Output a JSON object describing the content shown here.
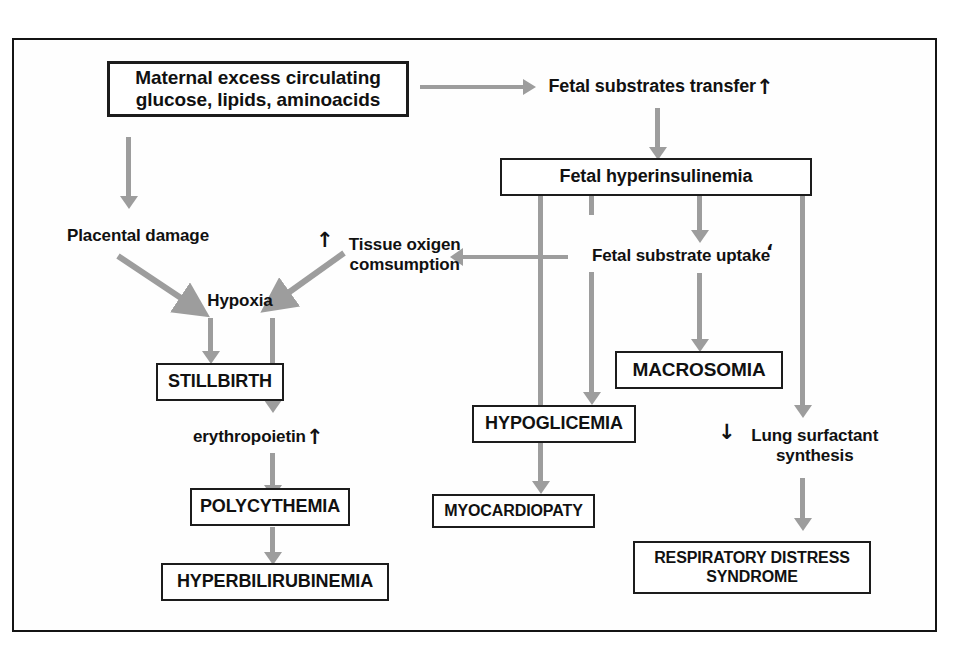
{
  "diagram": {
    "frame_color": "#141414",
    "arrow_color": "#9d9d9d",
    "text_color": "#111111",
    "background": "#ffffff"
  },
  "nodes": {
    "maternal_excess": {
      "label": "Maternal excess circulating\nglucose, lipids, aminoacids",
      "style": "boxed-thick"
    },
    "fetal_substrates_transfer": {
      "label": "Fetal substrates transfer",
      "arrow_glyph": "↑",
      "style": "plain"
    },
    "fetal_hyperinsulinemia": {
      "label": "Fetal hyperinsulinemia",
      "style": "boxed"
    },
    "placental_damage": {
      "label": "Placental damage",
      "style": "plain"
    },
    "tissue_oxigen": {
      "label": "Tissue oxigen\ncomsumption",
      "arrow_glyph": "↑",
      "style": "plain"
    },
    "fetal_substrate_uptake": {
      "label": "Fetal substrate uptake",
      "mark": "‘",
      "style": "plain"
    },
    "hypoxia": {
      "label": "Hypoxia",
      "style": "plain"
    },
    "stillbirth": {
      "label": "STILLBIRTH",
      "style": "boxed"
    },
    "erythropoietin": {
      "label": "erythropoietin",
      "arrow_glyph": "↑",
      "style": "plain"
    },
    "macrosomia": {
      "label": "MACROSOMIA",
      "style": "boxed"
    },
    "hypoglicemia": {
      "label": "HYPOGLICEMIA",
      "style": "boxed"
    },
    "lung_surfactant": {
      "label": "Lung surfactant\nsynthesis",
      "arrow_glyph": "↓",
      "style": "plain"
    },
    "polycythemia": {
      "label": "POLYCYTHEMIA",
      "style": "boxed"
    },
    "myocardiopaty": {
      "label": "MYOCARDIOPATY",
      "style": "boxed"
    },
    "hyperbilirubinemia": {
      "label": "HYPERBILIRUBINEMIA",
      "style": "boxed"
    },
    "respiratory_distress": {
      "label": "RESPIRATORY DISTRESS\nSYNDROME",
      "style": "boxed"
    }
  },
  "edges": [
    {
      "from": "maternal_excess",
      "to": "fetal_substrates_transfer",
      "kind": "horizontal-arrow"
    },
    {
      "from": "maternal_excess",
      "to": "placental_damage",
      "kind": "vertical-arrow"
    },
    {
      "from": "fetal_substrates_transfer",
      "to": "fetal_hyperinsulinemia",
      "kind": "vertical-arrow"
    },
    {
      "from": "placental_damage",
      "to": "hypoxia",
      "kind": "diagonal-arrow"
    },
    {
      "from": "tissue_oxigen",
      "to": "hypoxia",
      "kind": "diagonal-arrow"
    },
    {
      "from": "fetal_substrate_uptake",
      "to": "tissue_oxigen",
      "kind": "horizontal-arrow"
    },
    {
      "from": "fetal_hyperinsulinemia",
      "to": "fetal_substrate_uptake",
      "kind": "vertical-arrow"
    },
    {
      "from": "fetal_hyperinsulinemia",
      "to": "hypoglicemia",
      "kind": "vertical-arrow"
    },
    {
      "from": "fetal_hyperinsulinemia",
      "to": "myocardiopaty",
      "kind": "vertical-line"
    },
    {
      "from": "fetal_hyperinsulinemia",
      "to": "lung_surfactant",
      "kind": "vertical-arrow"
    },
    {
      "from": "fetal_substrate_uptake",
      "to": "macrosomia",
      "kind": "vertical-arrow"
    },
    {
      "from": "hypoxia",
      "to": "stillbirth",
      "kind": "vertical-arrow"
    },
    {
      "from": "hypoxia",
      "to": "erythropoietin",
      "kind": "vertical-arrow"
    },
    {
      "from": "erythropoietin",
      "to": "polycythemia",
      "kind": "vertical-arrow"
    },
    {
      "from": "polycythemia",
      "to": "hyperbilirubinemia",
      "kind": "vertical-arrow"
    },
    {
      "from": "hypoglicemia",
      "to": "myocardiopaty",
      "kind": "vertical-arrow"
    },
    {
      "from": "lung_surfactant",
      "to": "respiratory_distress",
      "kind": "vertical-arrow"
    }
  ]
}
